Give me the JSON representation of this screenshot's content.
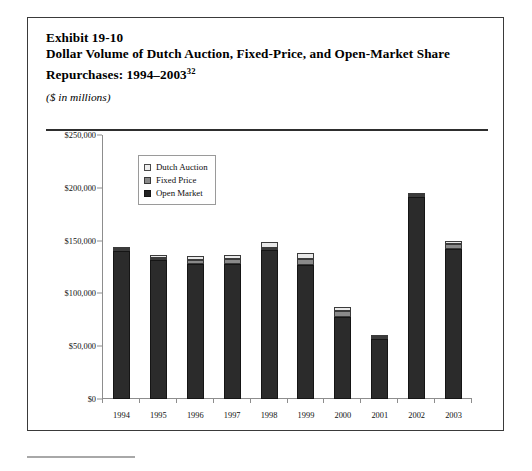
{
  "exhibit": {
    "number": "Exhibit 19-10",
    "title_line_1": "Dollar Volume of Dutch Auction, Fixed-Price, and Open-Market Share",
    "title_line_2_prefix": "Repurchases: 1994–2003",
    "title_footnote_marker": "32",
    "units": "($ in millions)"
  },
  "legend": {
    "items": [
      {
        "label": "Dutch Auction",
        "color": "#eeeeee",
        "swatch": "dutch-auction-swatch"
      },
      {
        "label": "Fixed Price",
        "color": "#8a8a8a",
        "swatch": "fixed-price-swatch"
      },
      {
        "label": "Open Market",
        "color": "#232323",
        "swatch": "open-market-swatch"
      }
    ]
  },
  "chart_data": {
    "type": "bar",
    "subtype": "stacked-column",
    "title": "Dollar Volume of Dutch Auction, Fixed-Price, and Open-Market Share Repurchases: 1994–2003",
    "xlabel": "",
    "ylabel": "($ in millions)",
    "ylim": [
      0,
      250000
    ],
    "yticks": [
      0,
      50000,
      100000,
      150000,
      200000,
      250000
    ],
    "ytick_labels": [
      "$0",
      "$50,000",
      "$100,000",
      "$150,000",
      "$200,000",
      "$250,000"
    ],
    "grid": false,
    "legend_position": "upper-left-inside",
    "categories": [
      "1994",
      "1995",
      "1996",
      "1997",
      "1998",
      "1999",
      "2000",
      "2001",
      "2002",
      "2003"
    ],
    "series": [
      {
        "name": "Open Market",
        "color": "#2b2b2b",
        "values": [
          140000,
          132000,
          128000,
          128000,
          141000,
          127000,
          78000,
          57000,
          191000,
          142000
        ]
      },
      {
        "name": "Fixed Price",
        "color": "#8a8a8a",
        "values": [
          1500,
          2000,
          4000,
          5000,
          2000,
          6000,
          5000,
          1000,
          1500,
          5000
        ]
      },
      {
        "name": "Dutch Auction",
        "color": "#e9e9e9",
        "values": [
          1500,
          2000,
          3000,
          3000,
          6000,
          5000,
          4000,
          1000,
          1500,
          3000
        ]
      }
    ],
    "totals": [
      143000,
      136000,
      135000,
      136000,
      149000,
      138000,
      87000,
      59000,
      194000,
      150000
    ]
  }
}
